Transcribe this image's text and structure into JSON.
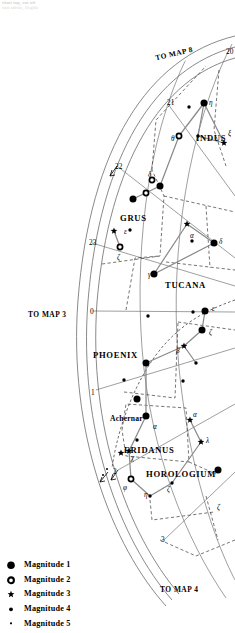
{
  "header": {
    "line1": "chart top, cut off",
    "line2": "faint subtitle, illegible"
  },
  "map_refs": [
    {
      "name": "to-map-8",
      "label": "TO MAP 8",
      "x": 155,
      "y": 50,
      "rot": -13
    },
    {
      "name": "to-map-3",
      "label": "TO MAP 3",
      "x": 28,
      "y": 311,
      "rot": 0
    },
    {
      "name": "to-map-4",
      "label": "TO MAP 4",
      "x": 160,
      "y": 586,
      "rot": 0
    }
  ],
  "hour_labels": [
    {
      "label": "20",
      "x": 226,
      "y": 48
    },
    {
      "label": "21",
      "x": 167,
      "y": 99
    },
    {
      "label": "22",
      "x": 115,
      "y": 163
    },
    {
      "label": "23",
      "x": 89,
      "y": 239
    },
    {
      "label": "0",
      "x": 90,
      "y": 308
    },
    {
      "label": "1",
      "x": 91,
      "y": 389
    },
    {
      "label": "2",
      "x": 113,
      "y": 468
    },
    {
      "label": "3",
      "x": 161,
      "y": 536
    }
  ],
  "constellations": [
    {
      "name": "indus",
      "label": "INDUS",
      "x": 196,
      "y": 134
    },
    {
      "name": "grus",
      "label": "GRUS",
      "x": 120,
      "y": 214
    },
    {
      "name": "tucana",
      "label": "TUCANA",
      "x": 165,
      "y": 281
    },
    {
      "name": "phoenix",
      "label": "PHOENIX",
      "x": 93,
      "y": 351
    },
    {
      "name": "eridanus",
      "label": "ERIDANUS",
      "x": 124,
      "y": 446
    },
    {
      "name": "horologium",
      "label": "HOROLOGIUM",
      "x": 146,
      "y": 470
    }
  ],
  "named_stars": [
    {
      "name": "achernar",
      "label": "Achernar",
      "x": 110,
      "y": 415
    }
  ],
  "greek_labels": [
    {
      "name": "eta-indi",
      "label": "η",
      "x": 209,
      "y": 100
    },
    {
      "name": "theta-indi",
      "label": "θ",
      "x": 171,
      "y": 136
    },
    {
      "name": "xi-indi",
      "label": "ξ",
      "x": 228,
      "y": 131
    },
    {
      "name": "delta-indi",
      "label": "δ",
      "x": 148,
      "y": 172
    },
    {
      "name": "epsilon-gruis",
      "label": "ε",
      "x": 124,
      "y": 229
    },
    {
      "name": "zeta-gruis",
      "label": "ζ",
      "x": 117,
      "y": 255
    },
    {
      "name": "alpha-tucanae",
      "label": "α",
      "x": 190,
      "y": 233
    },
    {
      "name": "delta-tucanae",
      "label": "δ",
      "x": 219,
      "y": 239
    },
    {
      "name": "gamma-tucanae",
      "label": "γ",
      "x": 148,
      "y": 272
    },
    {
      "name": "epsilon-phe",
      "label": "ε",
      "x": 212,
      "y": 306
    },
    {
      "name": "zeta-phe",
      "label": "ζ",
      "x": 209,
      "y": 330
    },
    {
      "name": "beta-phe",
      "label": "β",
      "x": 176,
      "y": 348
    },
    {
      "name": "alpha-eridani",
      "label": "α",
      "x": 153,
      "y": 424
    },
    {
      "name": "alpha-hor",
      "label": "α",
      "x": 193,
      "y": 412
    },
    {
      "name": "lambda-hor",
      "label": "λ",
      "x": 206,
      "y": 438
    },
    {
      "name": "chi-eridani",
      "label": "χ",
      "x": 131,
      "y": 455
    },
    {
      "name": "phi-eridani",
      "label": "φ",
      "x": 123,
      "y": 485
    },
    {
      "name": "eta-hor",
      "label": "η",
      "x": 144,
      "y": 492
    },
    {
      "name": "zeta-hor",
      "label": "ζ",
      "x": 167,
      "y": 487
    },
    {
      "name": "zeta-ret",
      "label": "ζ",
      "x": 217,
      "y": 505
    }
  ],
  "stars": [
    {
      "mag": 1,
      "x": 204,
      "y": 103
    },
    {
      "mag": 4,
      "x": 189,
      "y": 107
    },
    {
      "mag": 2,
      "x": 179,
      "y": 136
    },
    {
      "mag": 4,
      "x": 198,
      "y": 136
    },
    {
      "mag": 3,
      "x": 224,
      "y": 143
    },
    {
      "mag": 2,
      "x": 152,
      "y": 180
    },
    {
      "mag": 1,
      "x": 160,
      "y": 186
    },
    {
      "mag": 2,
      "x": 146,
      "y": 193
    },
    {
      "mag": 1,
      "x": 133,
      "y": 199
    },
    {
      "mag": 3,
      "x": 114,
      "y": 231
    },
    {
      "mag": 4,
      "x": 130,
      "y": 230
    },
    {
      "mag": 2,
      "x": 120,
      "y": 247
    },
    {
      "mag": 3,
      "x": 187,
      "y": 224
    },
    {
      "mag": 4,
      "x": 192,
      "y": 241
    },
    {
      "mag": 1,
      "x": 214,
      "y": 243
    },
    {
      "mag": 1,
      "x": 154,
      "y": 274
    },
    {
      "mag": 4,
      "x": 148,
      "y": 316
    },
    {
      "mag": 4,
      "x": 193,
      "y": 312
    },
    {
      "mag": 1,
      "x": 205,
      "y": 311
    },
    {
      "mag": 1,
      "x": 202,
      "y": 330
    },
    {
      "mag": 3,
      "x": 184,
      "y": 346
    },
    {
      "mag": 4,
      "x": 196,
      "y": 363
    },
    {
      "mag": 1,
      "x": 146,
      "y": 363
    },
    {
      "mag": 4,
      "x": 124,
      "y": 380
    },
    {
      "mag": 4,
      "x": 183,
      "y": 381
    },
    {
      "mag": 1,
      "x": 137,
      "y": 399
    },
    {
      "mag": 1,
      "x": 146,
      "y": 416
    },
    {
      "mag": 3,
      "x": 190,
      "y": 420
    },
    {
      "mag": 4,
      "x": 137,
      "y": 440
    },
    {
      "mag": 3,
      "x": 201,
      "y": 442
    },
    {
      "mag": 3,
      "x": 129,
      "y": 451
    },
    {
      "mag": 3,
      "x": 121,
      "y": 453
    },
    {
      "mag": 2,
      "x": 131,
      "y": 479
    },
    {
      "mag": 4,
      "x": 150,
      "y": 496
    },
    {
      "mag": 4,
      "x": 172,
      "y": 483
    },
    {
      "mag": 1,
      "x": 218,
      "y": 470
    },
    {
      "mag": 5,
      "x": 107,
      "y": 469
    },
    {
      "mag": 5,
      "x": 103,
      "y": 475
    }
  ],
  "constellation_lines": [
    [
      [
        204,
        103
      ],
      [
        179,
        136
      ]
    ],
    [
      [
        204,
        103
      ],
      [
        198,
        136
      ]
    ],
    [
      [
        198,
        136
      ],
      [
        224,
        143
      ]
    ],
    [
      [
        204,
        103
      ],
      [
        224,
        143
      ]
    ],
    [
      [
        179,
        136
      ],
      [
        160,
        186
      ]
    ],
    [
      [
        160,
        186
      ],
      [
        133,
        199
      ]
    ],
    [
      [
        187,
        224
      ],
      [
        214,
        243
      ]
    ],
    [
      [
        187,
        224
      ],
      [
        154,
        274
      ]
    ],
    [
      [
        214,
        243
      ],
      [
        154,
        274
      ]
    ],
    [
      [
        114,
        231
      ],
      [
        120,
        247
      ]
    ],
    [
      [
        205,
        311
      ],
      [
        202,
        330
      ]
    ],
    [
      [
        202,
        330
      ],
      [
        184,
        346
      ]
    ],
    [
      [
        184,
        346
      ],
      [
        146,
        363
      ]
    ],
    [
      [
        184,
        346
      ],
      [
        196,
        363
      ]
    ],
    [
      [
        146,
        363
      ],
      [
        146,
        416
      ]
    ],
    [
      [
        190,
        420
      ],
      [
        201,
        442
      ]
    ],
    [
      [
        201,
        442
      ],
      [
        172,
        483
      ]
    ],
    [
      [
        172,
        483
      ],
      [
        150,
        496
      ]
    ],
    [
      [
        150,
        496
      ],
      [
        131,
        479
      ]
    ],
    [
      [
        131,
        479
      ],
      [
        129,
        451
      ]
    ],
    [
      [
        129,
        451
      ],
      [
        146,
        416
      ]
    ]
  ],
  "legend": {
    "title": "",
    "items": [
      {
        "symbol": "filled-large",
        "label": "Magnitude 1",
        "mag": 1
      },
      {
        "symbol": "open-circle",
        "label": "Magnitude 2",
        "mag": 2
      },
      {
        "symbol": "star",
        "label": "Magnitude 3",
        "mag": 3
      },
      {
        "symbol": "filled-small",
        "label": "Magnitude 4",
        "mag": 4
      },
      {
        "symbol": "filled-dot",
        "label": "Magnitude 5",
        "mag": 5
      }
    ]
  },
  "colors": {
    "ink": "#000000",
    "grid": "#6b6b6b",
    "conline": "#8a8a8a",
    "dash": "#555555",
    "header": "#b9b9b9"
  }
}
